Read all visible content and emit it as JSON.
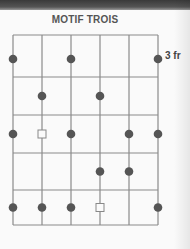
{
  "title": "MOTIF TROIS",
  "fret_label": "3 fr",
  "colors": {
    "line": "#8a8a8a",
    "dot": "#555555",
    "square": "#888888"
  },
  "diagram": {
    "strings": 6,
    "frets": 5,
    "dots": [
      {
        "fret": 1,
        "string": 1
      },
      {
        "fret": 1,
        "string": 3
      },
      {
        "fret": 1,
        "string": 6
      },
      {
        "fret": 2,
        "string": 2
      },
      {
        "fret": 2,
        "string": 4
      },
      {
        "fret": 3,
        "string": 1
      },
      {
        "fret": 3,
        "string": 3
      },
      {
        "fret": 3,
        "string": 5
      },
      {
        "fret": 3,
        "string": 6
      },
      {
        "fret": 4,
        "string": 4
      },
      {
        "fret": 4,
        "string": 5
      },
      {
        "fret": 5,
        "string": 1
      },
      {
        "fret": 5,
        "string": 2
      },
      {
        "fret": 5,
        "string": 3
      },
      {
        "fret": 5,
        "string": 6
      }
    ],
    "roots": [
      {
        "fret": 3,
        "string": 2
      },
      {
        "fret": 5,
        "string": 4
      }
    ]
  }
}
